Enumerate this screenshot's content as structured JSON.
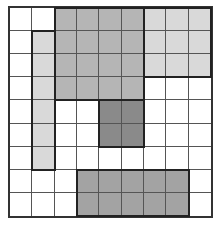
{
  "grid": {
    "rows": 9,
    "cols": 9,
    "colors": {
      "W": "#ffffff",
      "L": "#d9d9d9",
      "M": "#b5b5b5",
      "B": "#a3a3a3",
      "D": "#8a8a8a"
    },
    "cells": [
      [
        "W",
        "W",
        "M",
        "M",
        "M",
        "M",
        "L",
        "L",
        "L"
      ],
      [
        "W",
        "L",
        "M",
        "M",
        "M",
        "M",
        "L",
        "L",
        "L"
      ],
      [
        "W",
        "L",
        "M",
        "M",
        "M",
        "M",
        "L",
        "L",
        "L"
      ],
      [
        "W",
        "L",
        "M",
        "M",
        "M",
        "M",
        "W",
        "W",
        "W"
      ],
      [
        "W",
        "L",
        "W",
        "W",
        "D",
        "D",
        "W",
        "W",
        "W"
      ],
      [
        "W",
        "L",
        "W",
        "W",
        "D",
        "D",
        "W",
        "W",
        "W"
      ],
      [
        "W",
        "L",
        "W",
        "W",
        "W",
        "W",
        "W",
        "W",
        "W"
      ],
      [
        "W",
        "W",
        "W",
        "B",
        "B",
        "B",
        "B",
        "B",
        "W"
      ],
      [
        "W",
        "W",
        "W",
        "B",
        "B",
        "B",
        "B",
        "B",
        "W"
      ]
    ],
    "regions": [
      {
        "name": "top-medium-block",
        "row": 0,
        "col": 2,
        "rows": 4,
        "cols": 4
      },
      {
        "name": "top-right-light-block",
        "row": 0,
        "col": 6,
        "rows": 3,
        "cols": 3
      },
      {
        "name": "left-light-strip",
        "row": 1,
        "col": 1,
        "rows": 6,
        "cols": 1
      },
      {
        "name": "center-dark-block",
        "row": 4,
        "col": 4,
        "rows": 2,
        "cols": 2
      },
      {
        "name": "bottom-block",
        "row": 7,
        "col": 3,
        "rows": 2,
        "cols": 5
      }
    ]
  }
}
